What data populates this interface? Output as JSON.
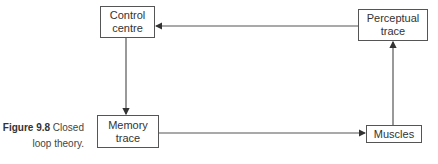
{
  "diagram": {
    "nodes": {
      "control_centre": "Control\ncentre",
      "perceptual_trace": "Perceptual\ntrace",
      "memory_trace": "Memory\ntrace",
      "muscles": "Muscles"
    },
    "edges": [
      {
        "from": "control_centre",
        "to": "memory_trace"
      },
      {
        "from": "memory_trace",
        "to": "muscles"
      },
      {
        "from": "muscles",
        "to": "perceptual_trace"
      },
      {
        "from": "perceptual_trace",
        "to": "control_centre"
      }
    ],
    "line_color": "#555555"
  },
  "caption": {
    "label": "Figure 9.8",
    "text_line1": "Closed",
    "text_line2": "loop theory."
  }
}
